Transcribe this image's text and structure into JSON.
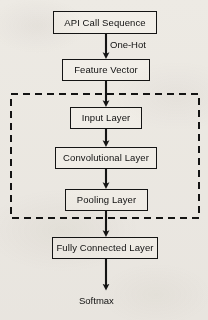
{
  "diagram": {
    "background_color": "#f2f0ec",
    "stroke_color": "#141414",
    "node_fill": "#f7f5f1",
    "nodes": [
      {
        "id": "api-call-sequence",
        "label": "API Call Sequence",
        "x": 53,
        "y": 11,
        "w": 104,
        "h": 23,
        "font_size": 9.5
      },
      {
        "id": "feature-vector",
        "label": "Feature Vector",
        "x": 62,
        "y": 59,
        "w": 88,
        "h": 22,
        "font_size": 9.5
      },
      {
        "id": "input-layer",
        "label": "Input Layer",
        "x": 70,
        "y": 107,
        "w": 72,
        "h": 22,
        "font_size": 9.5
      },
      {
        "id": "convolutional-layer",
        "label": "Convolutional Layer",
        "x": 55,
        "y": 147,
        "w": 102,
        "h": 22,
        "font_size": 9.5
      },
      {
        "id": "pooling-layer",
        "label": "Pooling Layer",
        "x": 65,
        "y": 189,
        "w": 83,
        "h": 22,
        "font_size": 9.5
      },
      {
        "id": "fully-connected",
        "label": "Fully Connected Layer",
        "x": 52,
        "y": 237,
        "w": 106,
        "h": 22,
        "font_size": 9.5
      }
    ],
    "edge_labels": [
      {
        "id": "one-hot",
        "label": "One-Hot",
        "x": 110,
        "y": 40,
        "font_size": 9.5
      }
    ],
    "terminal_labels": [
      {
        "id": "softmax",
        "label": "Softmax",
        "x": 79,
        "y": 296,
        "font_size": 9.5
      }
    ],
    "group_box": {
      "id": "cnn-group",
      "label": "",
      "x": 11,
      "y": 94,
      "w": 188,
      "h": 124,
      "style": "dashed"
    },
    "arrows": [
      {
        "id": "api-to-feature",
        "from": "api-call-sequence",
        "to": "feature-vector",
        "x": 106,
        "y1": 34,
        "y2": 59
      },
      {
        "id": "feature-to-input",
        "from": "feature-vector",
        "to": "input-layer",
        "x": 106,
        "y1": 81,
        "y2": 107
      },
      {
        "id": "input-to-conv",
        "from": "input-layer",
        "to": "convolutional-layer",
        "x": 106,
        "y1": 129,
        "y2": 147
      },
      {
        "id": "conv-to-pooling",
        "from": "convolutional-layer",
        "to": "pooling-layer",
        "x": 106,
        "y1": 169,
        "y2": 189
      },
      {
        "id": "pooling-to-fc",
        "from": "pooling-layer",
        "to": "fully-connected",
        "x": 106,
        "y1": 211,
        "y2": 237
      },
      {
        "id": "fc-to-softmax",
        "from": "fully-connected",
        "to": "softmax",
        "x": 106,
        "y1": 259,
        "y2": 290
      }
    ]
  }
}
